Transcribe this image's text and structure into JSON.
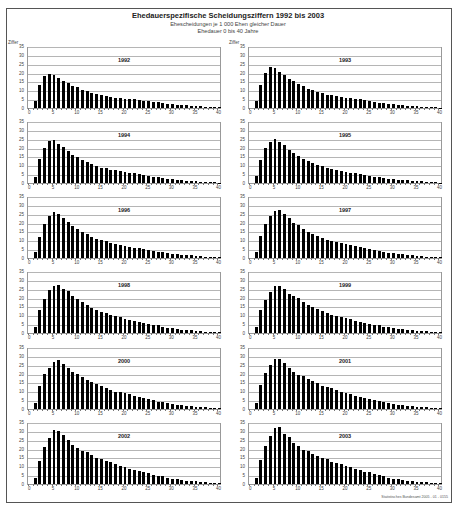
{
  "header": {
    "title": "Ehedauerspezifische Scheidungsziffern 1992 bis 2003",
    "subtitle1": "Ehescheidungen je 1 000 Ehen gleicher Dauer",
    "subtitle2": "Ehedauer 0 bis 40 Jahre"
  },
  "axis": {
    "y_label": "Ziffer",
    "y_ticks": [
      "0",
      "5",
      "10",
      "15",
      "20",
      "25",
      "30",
      "35"
    ],
    "x_ticks": [
      "0",
      "5",
      "10",
      "15",
      "20",
      "25",
      "30",
      "35",
      "40"
    ]
  },
  "footer": {
    "credit": "Statistisches Bundesamt 2005 - 01 - 0155"
  },
  "colors": {
    "bar": "#000000",
    "grid": "#b5b5b5",
    "frame": "#555555"
  },
  "chart_data": [
    {
      "type": "bar",
      "title": "1992",
      "xlabel": "Ehedauer (Jahre)",
      "ylabel": "Ziffer",
      "ylim": [
        0,
        35
      ],
      "xlim": [
        0,
        40
      ],
      "grid": true,
      "x": [
        1,
        2,
        3,
        4,
        5,
        6,
        7,
        8,
        9,
        10,
        11,
        12,
        13,
        14,
        15,
        16,
        17,
        18,
        19,
        20,
        21,
        22,
        23,
        24,
        25,
        26,
        27,
        28,
        29,
        30,
        31,
        32,
        33,
        34,
        35,
        36,
        37,
        38,
        39,
        40
      ],
      "values": [
        4.2,
        13.5,
        18.8,
        19.6,
        19.2,
        17.8,
        16.0,
        14.5,
        13.0,
        12.2,
        10.5,
        9.9,
        8.8,
        8.1,
        7.5,
        7.0,
        6.6,
        6.0,
        5.6,
        5.4,
        5.2,
        5.0,
        4.6,
        4.3,
        4.0,
        3.6,
        3.3,
        3.0,
        2.6,
        2.3,
        2.0,
        1.8,
        1.5,
        1.3,
        1.1,
        0.9,
        0.8,
        0.6,
        0.5,
        0.4
      ]
    },
    {
      "type": "bar",
      "title": "1993",
      "xlabel": "Ehedauer (Jahre)",
      "ylabel": "Ziffer",
      "ylim": [
        0,
        35
      ],
      "xlim": [
        0,
        40
      ],
      "grid": true,
      "x": [
        1,
        2,
        3,
        4,
        5,
        6,
        7,
        8,
        9,
        10,
        11,
        12,
        13,
        14,
        15,
        16,
        17,
        18,
        19,
        20,
        21,
        22,
        23,
        24,
        25,
        26,
        27,
        28,
        29,
        30,
        31,
        32,
        33,
        34,
        35,
        36,
        37,
        38,
        39,
        40
      ],
      "values": [
        4.3,
        13.4,
        20.5,
        23.8,
        23.2,
        21.0,
        19.0,
        17.0,
        15.5,
        14.2,
        12.8,
        11.2,
        10.5,
        9.5,
        8.5,
        7.8,
        7.5,
        7.2,
        6.5,
        6.0,
        5.8,
        5.4,
        5.0,
        4.6,
        4.0,
        3.6,
        3.2,
        2.9,
        2.5,
        2.1,
        1.8,
        1.6,
        1.3,
        1.1,
        0.9,
        0.8,
        0.6,
        0.5,
        0.4,
        0.3
      ]
    },
    {
      "type": "bar",
      "title": "1994",
      "xlabel": "Ehedauer (Jahre)",
      "ylabel": "Ziffer",
      "ylim": [
        0,
        35
      ],
      "xlim": [
        0,
        40
      ],
      "grid": true,
      "x": [
        1,
        2,
        3,
        4,
        5,
        6,
        7,
        8,
        9,
        10,
        11,
        12,
        13,
        14,
        15,
        16,
        17,
        18,
        19,
        20,
        21,
        22,
        23,
        24,
        25,
        26,
        27,
        28,
        29,
        30,
        31,
        32,
        33,
        34,
        35,
        36,
        37,
        38,
        39,
        40
      ],
      "values": [
        3.8,
        13.8,
        20.5,
        24.4,
        25.0,
        23.0,
        20.8,
        18.8,
        16.6,
        15.2,
        13.4,
        12.4,
        11.2,
        10.0,
        9.0,
        8.5,
        7.8,
        7.4,
        6.8,
        6.2,
        5.8,
        5.6,
        5.2,
        4.8,
        4.2,
        3.8,
        3.4,
        3.0,
        2.6,
        2.2,
        1.9,
        1.7,
        1.4,
        1.2,
        1.0,
        0.8,
        0.6,
        0.5,
        0.4,
        0.3
      ]
    },
    {
      "type": "bar",
      "title": "1995",
      "xlabel": "Ehedauer (Jahre)",
      "ylabel": "Ziffer",
      "ylim": [
        0,
        35
      ],
      "xlim": [
        0,
        40
      ],
      "grid": true,
      "x": [
        1,
        2,
        3,
        4,
        5,
        6,
        7,
        8,
        9,
        10,
        11,
        12,
        13,
        14,
        15,
        16,
        17,
        18,
        19,
        20,
        21,
        22,
        23,
        24,
        25,
        26,
        27,
        28,
        29,
        30,
        31,
        32,
        33,
        34,
        35,
        36,
        37,
        38,
        39,
        40
      ],
      "values": [
        3.9,
        13.2,
        20.2,
        24.2,
        25.6,
        24.2,
        22.0,
        19.4,
        17.6,
        15.8,
        14.2,
        12.6,
        11.6,
        10.6,
        9.8,
        9.0,
        8.2,
        7.6,
        7.2,
        6.6,
        6.0,
        5.6,
        5.2,
        4.8,
        4.2,
        3.8,
        3.4,
        3.0,
        2.6,
        2.2,
        2.0,
        1.8,
        1.5,
        1.3,
        1.1,
        0.9,
        0.7,
        0.6,
        0.4,
        0.3
      ]
    },
    {
      "type": "bar",
      "title": "1996",
      "xlabel": "Ehedauer (Jahre)",
      "ylabel": "Ziffer",
      "ylim": [
        0,
        35
      ],
      "xlim": [
        0,
        40
      ],
      "grid": true,
      "x": [
        1,
        2,
        3,
        4,
        5,
        6,
        7,
        8,
        9,
        10,
        11,
        12,
        13,
        14,
        15,
        16,
        17,
        18,
        19,
        20,
        21,
        22,
        23,
        24,
        25,
        26,
        27,
        28,
        29,
        30,
        31,
        32,
        33,
        34,
        35,
        36,
        37,
        38,
        39,
        40
      ],
      "values": [
        3.7,
        12.5,
        19.8,
        24.8,
        26.8,
        25.8,
        23.6,
        21.2,
        18.8,
        17.2,
        15.2,
        13.8,
        12.5,
        11.2,
        10.5,
        9.8,
        9.0,
        8.4,
        7.8,
        7.2,
        6.6,
        6.0,
        5.6,
        5.2,
        4.8,
        4.2,
        3.8,
        3.4,
        3.0,
        2.6,
        2.2,
        2.0,
        1.8,
        1.5,
        1.2,
        1.0,
        0.8,
        0.7,
        0.5,
        0.4
      ]
    },
    {
      "type": "bar",
      "title": "1997",
      "xlabel": "Ehedauer (Jahre)",
      "ylabel": "Ziffer",
      "ylim": [
        0,
        35
      ],
      "xlim": [
        0,
        40
      ],
      "grid": true,
      "x": [
        1,
        2,
        3,
        4,
        5,
        6,
        7,
        8,
        9,
        10,
        11,
        12,
        13,
        14,
        15,
        16,
        17,
        18,
        19,
        20,
        21,
        22,
        23,
        24,
        25,
        26,
        27,
        28,
        29,
        30,
        31,
        32,
        33,
        34,
        35,
        36,
        37,
        38,
        39,
        40
      ],
      "values": [
        3.6,
        13.0,
        19.8,
        24.6,
        27.6,
        28.2,
        25.6,
        23.6,
        20.6,
        19.2,
        17.2,
        15.2,
        14.0,
        12.6,
        11.6,
        10.6,
        10.0,
        9.2,
        8.6,
        8.0,
        7.4,
        6.8,
        6.2,
        5.6,
        5.0,
        4.6,
        4.2,
        3.8,
        3.2,
        2.8,
        2.4,
        2.1,
        1.8,
        1.5,
        1.2,
        1.0,
        0.8,
        0.7,
        0.5,
        0.4
      ]
    },
    {
      "type": "bar",
      "title": "1998",
      "xlabel": "Ehedauer (Jahre)",
      "ylabel": "Ziffer",
      "ylim": [
        0,
        35
      ],
      "xlim": [
        0,
        40
      ],
      "grid": true,
      "x": [
        1,
        2,
        3,
        4,
        5,
        6,
        7,
        8,
        9,
        10,
        11,
        12,
        13,
        14,
        15,
        16,
        17,
        18,
        19,
        20,
        21,
        22,
        23,
        24,
        25,
        26,
        27,
        28,
        29,
        30,
        31,
        32,
        33,
        34,
        35,
        36,
        37,
        38,
        39,
        40
      ],
      "values": [
        3.8,
        13.4,
        20.0,
        25.0,
        27.6,
        28.0,
        25.6,
        24.4,
        21.8,
        20.0,
        18.2,
        16.2,
        14.6,
        13.6,
        12.4,
        11.4,
        10.6,
        10.0,
        9.6,
        8.4,
        7.8,
        7.0,
        6.4,
        5.8,
        5.2,
        4.8,
        4.4,
        3.8,
        3.2,
        2.8,
        2.4,
        2.0,
        1.8,
        1.5,
        1.2,
        1.0,
        0.8,
        0.6,
        0.5,
        0.4
      ]
    },
    {
      "type": "bar",
      "title": "1999",
      "xlabel": "Ehedauer (Jahre)",
      "ylabel": "Ziffer",
      "ylim": [
        0,
        35
      ],
      "xlim": [
        0,
        40
      ],
      "grid": true,
      "x": [
        1,
        2,
        3,
        4,
        5,
        6,
        7,
        8,
        9,
        10,
        11,
        12,
        13,
        14,
        15,
        16,
        17,
        18,
        19,
        20,
        21,
        22,
        23,
        24,
        25,
        26,
        27,
        28,
        29,
        30,
        31,
        32,
        33,
        34,
        35,
        36,
        37,
        38,
        39,
        40
      ],
      "values": [
        3.6,
        13.6,
        19.4,
        24.2,
        27.2,
        27.2,
        25.6,
        23.0,
        21.8,
        20.6,
        18.0,
        16.4,
        15.0,
        13.8,
        12.6,
        11.6,
        10.6,
        10.2,
        9.4,
        8.6,
        8.0,
        7.2,
        6.6,
        5.8,
        5.2,
        4.8,
        4.4,
        3.8,
        3.4,
        2.8,
        2.4,
        2.1,
        1.8,
        1.5,
        1.3,
        1.1,
        0.9,
        0.7,
        0.5,
        0.4
      ]
    },
    {
      "type": "bar",
      "title": "2000",
      "xlabel": "Ehedauer (Jahre)",
      "ylabel": "Ziffer",
      "ylim": [
        0,
        35
      ],
      "xlim": [
        0,
        40
      ],
      "grid": true,
      "x": [
        1,
        2,
        3,
        4,
        5,
        6,
        7,
        8,
        9,
        10,
        11,
        12,
        13,
        14,
        15,
        16,
        17,
        18,
        19,
        20,
        21,
        22,
        23,
        24,
        25,
        26,
        27,
        28,
        29,
        30,
        31,
        32,
        33,
        34,
        35,
        36,
        37,
        38,
        39,
        40
      ],
      "values": [
        3.4,
        13.4,
        20.6,
        24.2,
        27.6,
        28.4,
        26.0,
        24.0,
        21.6,
        20.6,
        18.8,
        17.0,
        15.6,
        14.4,
        13.2,
        12.0,
        11.0,
        10.2,
        9.8,
        9.2,
        8.6,
        7.8,
        6.8,
        6.2,
        5.6,
        5.0,
        4.2,
        4.0,
        3.4,
        3.0,
        2.6,
        2.2,
        1.9,
        1.6,
        1.4,
        1.1,
        0.9,
        0.7,
        0.5,
        0.4
      ]
    },
    {
      "type": "bar",
      "title": "2001",
      "xlabel": "Ehedauer (Jahre)",
      "ylabel": "Ziffer",
      "ylim": [
        0,
        35
      ],
      "xlim": [
        0,
        40
      ],
      "grid": true,
      "x": [
        1,
        2,
        3,
        4,
        5,
        6,
        7,
        8,
        9,
        10,
        11,
        12,
        13,
        14,
        15,
        16,
        17,
        18,
        19,
        20,
        21,
        22,
        23,
        24,
        25,
        26,
        27,
        28,
        29,
        30,
        31,
        32,
        33,
        34,
        35,
        36,
        37,
        38,
        39,
        40
      ],
      "values": [
        3.6,
        13.8,
        21.0,
        25.8,
        29.0,
        29.2,
        27.0,
        24.0,
        21.6,
        20.0,
        19.0,
        17.4,
        16.2,
        15.0,
        13.6,
        12.6,
        12.0,
        11.0,
        10.2,
        9.6,
        8.8,
        7.8,
        7.2,
        6.6,
        5.8,
        5.2,
        4.6,
        4.0,
        3.6,
        3.0,
        2.6,
        2.2,
        1.9,
        1.6,
        1.4,
        1.1,
        0.9,
        0.7,
        0.5,
        0.4
      ]
    },
    {
      "type": "bar",
      "title": "2002",
      "xlabel": "Ehedauer (Jahre)",
      "ylabel": "Ziffer",
      "ylim": [
        0,
        35
      ],
      "xlim": [
        0,
        40
      ],
      "grid": true,
      "x": [
        1,
        2,
        3,
        4,
        5,
        6,
        7,
        8,
        9,
        10,
        11,
        12,
        13,
        14,
        15,
        16,
        17,
        18,
        19,
        20,
        21,
        22,
        23,
        24,
        25,
        26,
        27,
        28,
        29,
        30,
        31,
        32,
        33,
        34,
        35,
        36,
        37,
        38,
        39,
        40
      ],
      "values": [
        3.4,
        13.6,
        21.8,
        26.8,
        31.6,
        31.0,
        28.4,
        25.6,
        23.0,
        21.2,
        19.4,
        18.4,
        16.8,
        15.4,
        14.6,
        13.6,
        12.6,
        11.6,
        10.6,
        10.0,
        9.0,
        8.4,
        7.6,
        6.8,
        6.2,
        5.4,
        4.8,
        4.4,
        3.8,
        3.2,
        2.8,
        2.4,
        2.0,
        1.7,
        1.5,
        1.2,
        1.0,
        0.8,
        0.6,
        0.5
      ]
    },
    {
      "type": "bar",
      "title": "2003",
      "xlabel": "Ehedauer (Jahre)",
      "ylabel": "Ziffer",
      "ylim": [
        0,
        35
      ],
      "xlim": [
        0,
        40
      ],
      "grid": true,
      "x": [
        1,
        2,
        3,
        4,
        5,
        6,
        7,
        8,
        9,
        10,
        11,
        12,
        13,
        14,
        15,
        16,
        17,
        18,
        19,
        20,
        21,
        22,
        23,
        24,
        25,
        26,
        27,
        28,
        29,
        30,
        31,
        32,
        33,
        34,
        35,
        36,
        37,
        38,
        39,
        40
      ],
      "values": [
        3.8,
        14.0,
        22.2,
        28.0,
        32.4,
        33.2,
        29.2,
        27.2,
        23.8,
        22.0,
        20.0,
        19.0,
        17.6,
        16.2,
        15.0,
        14.6,
        12.8,
        12.2,
        11.4,
        10.6,
        10.0,
        9.0,
        8.2,
        7.2,
        6.8,
        5.8,
        5.0,
        4.4,
        3.8,
        3.2,
        2.8,
        2.4,
        2.0,
        1.7,
        1.4,
        1.2,
        1.0,
        0.8,
        0.6,
        0.5
      ]
    }
  ]
}
